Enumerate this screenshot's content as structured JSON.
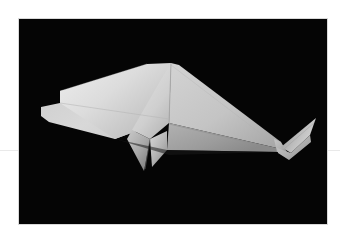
{
  "page": {
    "background_color": "#ffffff",
    "width": 340,
    "height": 244,
    "rule": {
      "color": "#e9e9e9",
      "y": 150
    }
  },
  "photo": {
    "alt": "origami paper whale on black background",
    "subject": "origami-whale",
    "background_color": "#050505",
    "border_color": "#d9d9d9",
    "frame": {
      "x": 19,
      "y": 19,
      "width": 308,
      "height": 205
    },
    "paper": {
      "highlight_color": "#e6e6e6",
      "light_color": "#d4d4d4",
      "mid_color": "#bdbdbd",
      "shade_color": "#9e9e9e",
      "dark_color": "#7d7d7d",
      "crease_color": "#8f8f8f"
    },
    "parts": [
      {
        "name": "head-snout",
        "tone": "light"
      },
      {
        "name": "upper-body-panel",
        "tone": "highlight"
      },
      {
        "name": "dorsal-ridge",
        "tone": "crease"
      },
      {
        "name": "flank-panel",
        "tone": "mid"
      },
      {
        "name": "center-fold-wedge",
        "tone": "light"
      },
      {
        "name": "front-flipper",
        "tone": "shade"
      },
      {
        "name": "rear-flipper",
        "tone": "shade"
      },
      {
        "name": "belly-panel",
        "tone": "shade"
      },
      {
        "name": "tail-stock",
        "tone": "mid"
      },
      {
        "name": "tail-fluke",
        "tone": "light"
      }
    ]
  }
}
